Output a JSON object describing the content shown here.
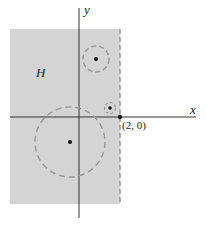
{
  "diagram": {
    "region_label": "H",
    "x_axis_label": "x",
    "y_axis_label": "y",
    "boundary_point_label": "(2, 0)",
    "colors": {
      "region": "#d4d4d4",
      "axis": "#333333",
      "dashed": "#999999",
      "dot": "#111111"
    }
  }
}
